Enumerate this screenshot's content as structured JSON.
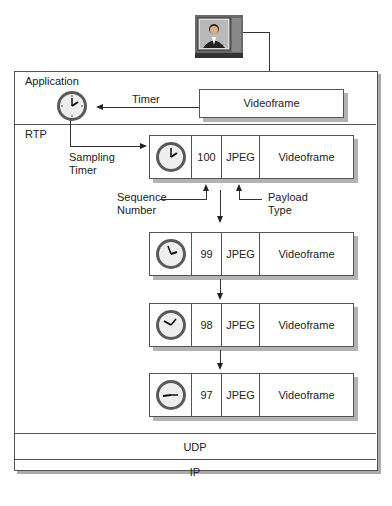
{
  "source": {
    "icon": "tv-monitor-icon"
  },
  "layers": {
    "application": {
      "label": "Application",
      "timer_label": "Timer",
      "videoframe_label": "Videoframe",
      "clock_icon": "clock-icon"
    },
    "rtp": {
      "label": "RTP",
      "sampling_timer_label": [
        "Sampling",
        "Timer"
      ],
      "sequence_number_label": [
        "Sequence",
        "Number"
      ],
      "payload_type_label": [
        "Payload",
        "Type"
      ],
      "packets": [
        {
          "seq": "100",
          "payload": "JPEG",
          "data": "Videoframe",
          "clock_time": "2:00"
        },
        {
          "seq": "99",
          "payload": "JPEG",
          "data": "Videoframe",
          "clock_time": "1:35"
        },
        {
          "seq": "98",
          "payload": "JPEG",
          "data": "Videoframe",
          "clock_time": "9:55"
        },
        {
          "seq": "97",
          "payload": "JPEG",
          "data": "Videoframe",
          "clock_time": "8:15"
        }
      ]
    },
    "udp": {
      "label": "UDP"
    },
    "ip": {
      "label": "IP"
    }
  },
  "colors": {
    "line": "#333333",
    "shadow": "#b3b3b3",
    "clock_rim": "#5a5a5a",
    "clock_face": "#eeeeee"
  }
}
